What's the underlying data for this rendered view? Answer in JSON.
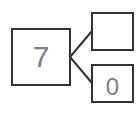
{
  "diagram": {
    "type": "number-bond",
    "whole": "7",
    "parts": [
      "",
      "0"
    ],
    "colors": {
      "stroke": "#333333",
      "text": "#808080"
    }
  }
}
